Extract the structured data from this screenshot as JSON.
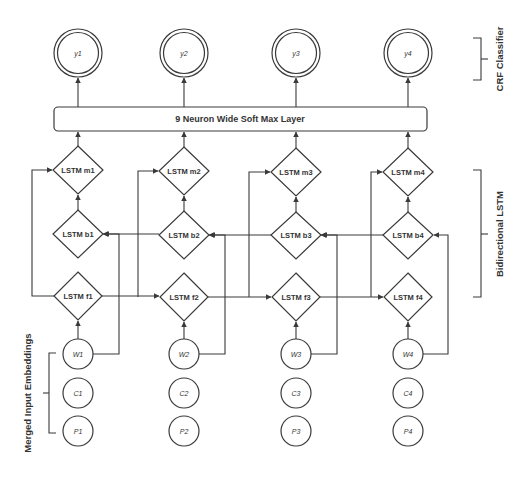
{
  "diagram": {
    "colors": {
      "line": "#3a3a3a",
      "background": "#ffffff",
      "text": "#333333"
    },
    "outputs": [
      "y1",
      "y2",
      "y3",
      "y4"
    ],
    "softmax_label": "9 Neuron Wide Soft Max Layer",
    "lstm_m": [
      "LSTM m1",
      "LSTM m2",
      "LSTM m3",
      "LSTM m4"
    ],
    "lstm_b": [
      "LSTM b1",
      "LSTM b2",
      "LSTM b3",
      "LSTM b4"
    ],
    "lstm_f": [
      "LSTM f1",
      "LSTM f2",
      "LSTM f3",
      "LSTM f4"
    ],
    "word_inputs": [
      "W1",
      "W2",
      "W3",
      "W4"
    ],
    "char_inputs": [
      "C1",
      "C2",
      "C3",
      "C4"
    ],
    "pos_inputs": [
      "P1",
      "P2",
      "P3",
      "P4"
    ],
    "brackets": {
      "crf": "CRF Classifier",
      "bilstm": "Bidirectional LSTM",
      "embeddings": "Merged Input Embeddings"
    }
  }
}
